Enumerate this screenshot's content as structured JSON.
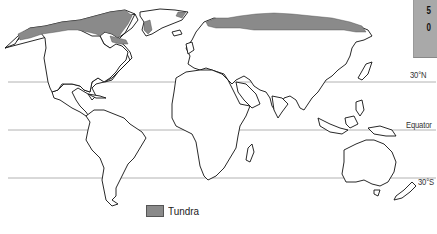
{
  "map": {
    "title": "",
    "projection": "world outline",
    "biome_color": "#8a8a8a",
    "outline_color": "#111111",
    "gridline_color": "#9a9a9a"
  },
  "latitude_lines": [
    {
      "label": "30°N",
      "y": 79
    },
    {
      "label": "Equator",
      "y": 129
    },
    {
      "label": "30°S",
      "y": 178
    }
  ],
  "side_panel": {
    "values": [
      "5",
      "0"
    ]
  },
  "legend": {
    "items": [
      {
        "label": "Tundra",
        "color": "#8a8a8a"
      }
    ]
  }
}
